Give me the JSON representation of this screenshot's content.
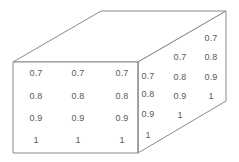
{
  "figure": {
    "name": "cuboid-value-grid",
    "background_color": "#ffffff",
    "edge_color": "#8a8a8a",
    "text_color": "#595959",
    "edge_width": 1
  },
  "chart_data": {
    "type": "table",
    "title": "",
    "subtitle": "",
    "xlabel": "",
    "ylabel": "",
    "grid": false,
    "legend": false,
    "projection": "oblique-3d-cuboid",
    "faces": [
      {
        "name": "front-face",
        "shape": "rectangle",
        "rows": 4,
        "columns": 3,
        "values": [
          [
            "0.7",
            "0.7",
            "0.7"
          ],
          [
            "0.8",
            "0.8",
            "0.8"
          ],
          [
            "0.9",
            "0.9",
            "0.9"
          ],
          [
            "1",
            "1",
            "1"
          ]
        ]
      },
      {
        "name": "right-face",
        "shape": "parallelogram",
        "rows": 4,
        "columns": 3,
        "values": [
          [
            "0.7",
            "0.8",
            "0.9",
            "1"
          ],
          [
            "0.7",
            "0.8",
            "0.9",
            "1"
          ],
          [
            "0.7",
            "0.8",
            "0.9",
            "1"
          ]
        ],
        "note": "columns listed top-to-bottom, each column shifted upward toward the right"
      },
      {
        "name": "top-face",
        "shape": "parallelogram",
        "rows": 0,
        "columns": 0,
        "values": []
      }
    ]
  },
  "geometry": {
    "front_top_left": [
      13,
      62
    ],
    "front_top_right": [
      138,
      62
    ],
    "front_bottom_right": [
      138,
      153
    ],
    "front_bottom_left": [
      13,
      153
    ],
    "back_top_left": [
      101,
      11
    ],
    "back_top_right": [
      226,
      11
    ],
    "back_bottom_right": [
      226,
      101
    ]
  },
  "front_labels": [
    {
      "text": "0.7",
      "x": 36,
      "y": 73
    },
    {
      "text": "0.7",
      "x": 78,
      "y": 73
    },
    {
      "text": "0.7",
      "x": 122,
      "y": 73
    },
    {
      "text": "0.8",
      "x": 36,
      "y": 96
    },
    {
      "text": "0.8",
      "x": 78,
      "y": 96
    },
    {
      "text": "0.8",
      "x": 122,
      "y": 96
    },
    {
      "text": "0.9",
      "x": 36,
      "y": 118
    },
    {
      "text": "0.9",
      "x": 78,
      "y": 118
    },
    {
      "text": "0.9",
      "x": 122,
      "y": 118
    },
    {
      "text": "1",
      "x": 36,
      "y": 140
    },
    {
      "text": "1",
      "x": 78,
      "y": 140
    },
    {
      "text": "1",
      "x": 122,
      "y": 140
    }
  ],
  "right_labels": [
    {
      "text": "0.7",
      "x": 148,
      "y": 76
    },
    {
      "text": "0.8",
      "x": 148,
      "y": 94
    },
    {
      "text": "0.9",
      "x": 148,
      "y": 114
    },
    {
      "text": "1",
      "x": 148,
      "y": 135
    },
    {
      "text": "0.7",
      "x": 180,
      "y": 57
    },
    {
      "text": "0.8",
      "x": 180,
      "y": 77
    },
    {
      "text": "0.9",
      "x": 180,
      "y": 96
    },
    {
      "text": "1",
      "x": 180,
      "y": 115
    },
    {
      "text": "0.7",
      "x": 211,
      "y": 38
    },
    {
      "text": "0.8",
      "x": 211,
      "y": 57
    },
    {
      "text": "0.9",
      "x": 211,
      "y": 77
    },
    {
      "text": "1",
      "x": 211,
      "y": 96
    }
  ]
}
